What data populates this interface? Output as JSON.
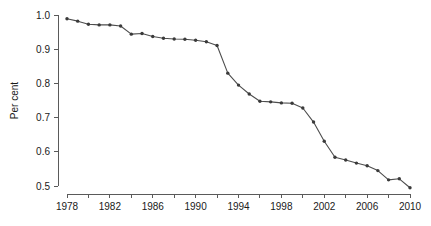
{
  "chart_data": {
    "type": "line",
    "title": "",
    "subtitle": "",
    "xlabel": "",
    "ylabel": "Per cent",
    "xlim": [
      1977,
      2011
    ],
    "ylim": [
      0.5,
      1.0
    ],
    "grid": false,
    "legend": null,
    "x_tick_labels": [
      "1978",
      "1982",
      "1986",
      "1990",
      "1994",
      "1998",
      "2002",
      "2006",
      "2010"
    ],
    "x_tick_values": [
      1978,
      1982,
      1986,
      1990,
      1994,
      1998,
      2002,
      2006,
      2010
    ],
    "x_minor_tick_values": [
      1980,
      1984,
      1988,
      1992,
      1996,
      2000,
      2004,
      2008,
      2010
    ],
    "y_tick_labels": [
      "0.5",
      "0.6",
      "0.7",
      "0.8",
      "0.9",
      "1.0"
    ],
    "y_tick_values": [
      0.5,
      0.6,
      0.7,
      0.8,
      0.9,
      1.0
    ],
    "marker": "circle",
    "line_color": "#4d4d4d",
    "marker_color": "#3a3a3a",
    "x": [
      1978,
      1979,
      1980,
      1981,
      1982,
      1983,
      1984,
      1985,
      1986,
      1987,
      1988,
      1989,
      1990,
      1991,
      1992,
      1993,
      1994,
      1995,
      1996,
      1997,
      1998,
      1999,
      2000,
      2001,
      2002,
      2003,
      2004,
      2005,
      2006,
      2007,
      2008,
      2009,
      2010
    ],
    "values": [
      0.989,
      0.982,
      0.973,
      0.971,
      0.971,
      0.968,
      0.944,
      0.946,
      0.937,
      0.932,
      0.93,
      0.929,
      0.926,
      0.922,
      0.911,
      0.83,
      0.795,
      0.769,
      0.748,
      0.746,
      0.743,
      0.742,
      0.728,
      0.687,
      0.631,
      0.584,
      0.576,
      0.567,
      0.559,
      0.545,
      0.518,
      0.521,
      0.495
    ],
    "series": [
      {
        "name": "Per cent",
        "values": [
          0.989,
          0.982,
          0.973,
          0.971,
          0.971,
          0.968,
          0.944,
          0.946,
          0.937,
          0.932,
          0.93,
          0.929,
          0.926,
          0.922,
          0.911,
          0.83,
          0.795,
          0.769,
          0.748,
          0.746,
          0.743,
          0.742,
          0.728,
          0.687,
          0.631,
          0.584,
          0.576,
          0.567,
          0.559,
          0.545,
          0.518,
          0.521,
          0.495
        ]
      }
    ]
  }
}
